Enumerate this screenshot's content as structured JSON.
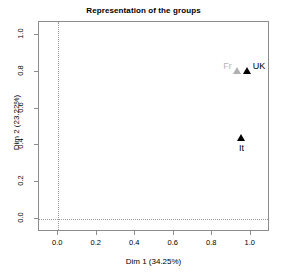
{
  "chart_data": {
    "type": "scatter",
    "title": "Representation of the groups",
    "xlabel": "Dim 1 (34.25%)",
    "ylabel": "Dim 2 (23.22%)",
    "xlim": [
      -0.1,
      1.1
    ],
    "ylim": [
      -0.07,
      1.07
    ],
    "xticks": [
      "0.0",
      "0.2",
      "0.4",
      "0.6",
      "0.8",
      "1.0"
    ],
    "xtick_values": [
      0.0,
      0.2,
      0.4,
      0.6,
      0.8,
      1.0
    ],
    "yticks": [
      "0.0",
      "0.2",
      "0.4",
      "0.6",
      "0.8",
      "1.0"
    ],
    "ytick_values": [
      0.0,
      0.2,
      0.4,
      0.6,
      0.8,
      1.0
    ],
    "grid": false,
    "legend": "none",
    "reference_lines": [
      {
        "axis": "vertical",
        "value": 0.0,
        "style": "dotted",
        "color": "#9a9a9a"
      },
      {
        "axis": "horizontal",
        "value": 0.0,
        "style": "dotted",
        "color": "#9a9a9a"
      }
    ],
    "marker_shape": "triangle",
    "points": [
      {
        "label": "Fr",
        "x": 0.935,
        "y": 0.8,
        "color": "#b0b0b0",
        "label_position": "left"
      },
      {
        "label": "UK",
        "x": 0.985,
        "y": 0.8,
        "color": "#000000",
        "label_position": "right"
      },
      {
        "label": "It",
        "x": 0.955,
        "y": 0.435,
        "color": "#000000",
        "label_position": "below"
      }
    ]
  },
  "colors": {
    "frame": "#8c8c8c",
    "reference_line": "#9a9a9a",
    "dark_group": "#000000",
    "light_group": "#b0b0b0",
    "background": "#ffffff"
  }
}
